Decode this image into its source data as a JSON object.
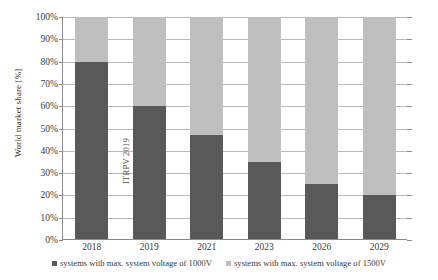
{
  "chart_data": {
    "type": "bar",
    "stacked": true,
    "percent_stacked": true,
    "title": "",
    "xlabel": "",
    "ylabel": "World market share [%]",
    "categories": [
      "2018",
      "2019",
      "2021",
      "2023",
      "2026",
      "2029"
    ],
    "ylim": [
      0,
      100
    ],
    "ytick_labels": [
      "0%",
      "10%",
      "20%",
      "30%",
      "40%",
      "50%",
      "60%",
      "70%",
      "80%",
      "90%",
      "100%"
    ],
    "ytick_values": [
      0,
      10,
      20,
      30,
      40,
      50,
      60,
      70,
      80,
      90,
      100
    ],
    "grid": true,
    "legend_position": "bottom",
    "series": [
      {
        "name": "systems with max. system voltage of 1000V",
        "color": "#595959",
        "values": [
          80,
          60,
          47,
          35,
          25,
          20
        ]
      },
      {
        "name": "systems with max. system voltage of 1500V",
        "color": "#bfbfbf",
        "values": [
          20,
          40,
          53,
          65,
          75,
          80
        ]
      }
    ],
    "annotations": [
      {
        "text": "ITRPV 2019",
        "orientation": "vertical",
        "x_category_gap": "between 2018 and 2019"
      }
    ]
  },
  "colors": {
    "series_1000v": "#595959",
    "series_1500v": "#bfbfbf",
    "axis": "#8c8c8c",
    "gridline": "#b9b9b9",
    "text": "#3a3a3a",
    "background": "#ffffff"
  }
}
